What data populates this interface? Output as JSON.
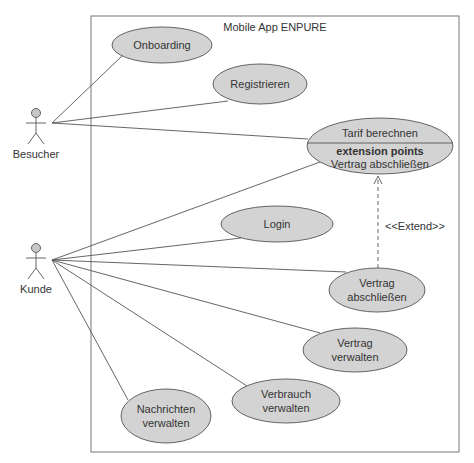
{
  "diagram": {
    "type": "uml-use-case",
    "system_boundary": {
      "title": "Mobile App ENPURE",
      "x": 91,
      "y": 16,
      "w": 368,
      "h": 436
    },
    "colors": {
      "ellipse_fill": "#d3d3d3",
      "stroke": "#555555",
      "text": "#333333",
      "actor_head": "#c8c8c8",
      "background": "#ffffff"
    },
    "actors": [
      {
        "id": "besucher",
        "label": "Besucher",
        "x": 36,
        "y": 113
      },
      {
        "id": "kunde",
        "label": "Kunde",
        "x": 36,
        "y": 248
      }
    ],
    "use_cases": [
      {
        "id": "onboarding",
        "lines": [
          "Onboarding"
        ],
        "cx": 162,
        "cy": 45,
        "rx": 50,
        "ry": 18
      },
      {
        "id": "registrieren",
        "lines": [
          "Registrieren"
        ],
        "cx": 260,
        "cy": 84,
        "rx": 47,
        "ry": 20
      },
      {
        "id": "tarif",
        "lines": [
          "Tarif berechnen"
        ],
        "extension_header": "extension points",
        "extension_point": "Vertrag abschließen",
        "cx": 380,
        "cy": 146,
        "rx": 73,
        "ry": 28
      },
      {
        "id": "login",
        "lines": [
          "Login"
        ],
        "cx": 277,
        "cy": 224,
        "rx": 56,
        "ry": 18
      },
      {
        "id": "vertrag_abschliessen",
        "lines": [
          "Vertrag",
          "abschließen"
        ],
        "cx": 377,
        "cy": 290,
        "rx": 48,
        "ry": 22
      },
      {
        "id": "vertrag_verwalten",
        "lines": [
          "Vertrag",
          "verwalten"
        ],
        "cx": 355,
        "cy": 350,
        "rx": 52,
        "ry": 22
      },
      {
        "id": "verbrauch_verwalten",
        "lines": [
          "Verbrauch",
          "verwalten"
        ],
        "cx": 286,
        "cy": 401,
        "rx": 54,
        "ry": 22
      },
      {
        "id": "nachrichten_verwalten",
        "lines": [
          "Nachrichten",
          "verwalten"
        ],
        "cx": 166,
        "cy": 416,
        "rx": 45,
        "ry": 27
      }
    ],
    "associations": [
      {
        "from": "besucher",
        "to": "onboarding",
        "x1": 52,
        "y1": 123,
        "x2": 122,
        "y2": 56
      },
      {
        "from": "besucher",
        "to": "registrieren",
        "x1": 52,
        "y1": 123,
        "x2": 228,
        "y2": 101
      },
      {
        "from": "besucher",
        "to": "tarif",
        "x1": 52,
        "y1": 123,
        "x2": 308,
        "y2": 139
      },
      {
        "from": "kunde",
        "to": "tarif",
        "x1": 52,
        "y1": 260,
        "x2": 320,
        "y2": 162
      },
      {
        "from": "kunde",
        "to": "login",
        "x1": 52,
        "y1": 260,
        "x2": 241,
        "y2": 238
      },
      {
        "from": "kunde",
        "to": "vertrag_abschliessen",
        "x1": 52,
        "y1": 260,
        "x2": 346,
        "y2": 272
      },
      {
        "from": "kunde",
        "to": "vertrag_verwalten",
        "x1": 52,
        "y1": 260,
        "x2": 320,
        "y2": 333
      },
      {
        "from": "kunde",
        "to": "verbrauch_verwalten",
        "x1": 52,
        "y1": 260,
        "x2": 247,
        "y2": 386
      },
      {
        "from": "kunde",
        "to": "nachrichten_verwalten",
        "x1": 52,
        "y1": 260,
        "x2": 128,
        "y2": 400
      }
    ],
    "extend": {
      "from": "vertrag_abschliessen",
      "to": "tarif",
      "label": "<<Extend>>",
      "x": 378,
      "y1": 268,
      "y2": 176,
      "label_x": 385,
      "label_y": 230
    }
  }
}
